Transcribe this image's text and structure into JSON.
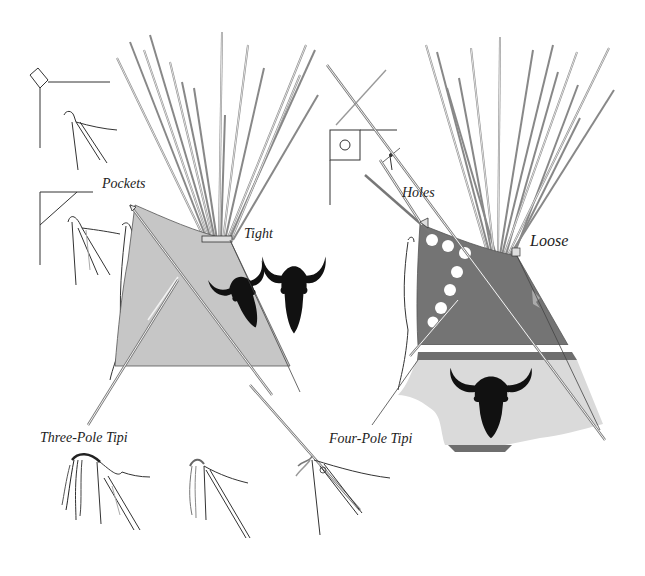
{
  "figure": {
    "colors": {
      "background": "#ffffff",
      "pole": "#f4f4f4",
      "pole_outline": "#777777",
      "line": "#333333",
      "three_pole_cover": "#c6c6c6",
      "four_pole_upper": "#747474",
      "four_pole_lower": "#dadada",
      "stripe_dark": "#6e6e6e",
      "stripe_white": "#ffffff",
      "buffalo": "#111111",
      "holes": "#ffffff"
    }
  },
  "labels": {
    "pockets": "Pockets",
    "tight": "Tight",
    "holes": "Holes",
    "loose": "Loose",
    "three_pole_tipi": "Three-Pole Tipi",
    "four_pole_tipi": "Four-Pole Tipi"
  },
  "diagrams": {
    "left": {
      "name": "Three-Pole Tipi",
      "smoke_flap_fastening": "Pockets",
      "cover_wrap": "Tight",
      "decoration": [
        "buffalo-skull",
        "buffalo-skull"
      ]
    },
    "right": {
      "name": "Four-Pole Tipi",
      "smoke_flap_fastening": "Holes",
      "cover_wrap": "Loose",
      "decoration": [
        "white-dots",
        "white-stripe",
        "buffalo-skull"
      ]
    }
  }
}
